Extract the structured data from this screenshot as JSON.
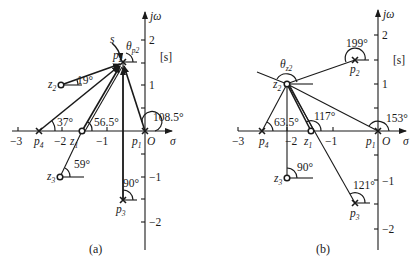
{
  "figure": {
    "panels": [
      {
        "id": "a",
        "caption": "(a)",
        "plane_label": "[s]",
        "axis": {
          "x_label": "σ",
          "y_label": "jω",
          "origin_label": "O",
          "x_ticks": [
            "−3",
            "−2",
            "−1"
          ],
          "y_ticks": [
            "2",
            "1",
            "−1",
            "−2"
          ]
        },
        "poles": [
          {
            "name": "p1",
            "label": "p",
            "sub": "1",
            "re": 0,
            "im": 0
          },
          {
            "name": "p2",
            "label": "p",
            "sub": "2",
            "re": -0.5,
            "im": 1.5
          },
          {
            "name": "p3",
            "label": "p",
            "sub": "3",
            "re": -0.5,
            "im": -1.5
          },
          {
            "name": "p4",
            "label": "p",
            "sub": "4",
            "re": -2.5,
            "im": 0
          }
        ],
        "zeros": [
          {
            "name": "z1",
            "label": "z",
            "sub": "1",
            "re": -1.5,
            "im": 0
          },
          {
            "name": "z2",
            "label": "z",
            "sub": "2",
            "re": -2,
            "im": 1
          },
          {
            "name": "z3",
            "label": "z",
            "sub": "3",
            "re": -2,
            "im": -1
          }
        ],
        "angles": [
          "19°",
          "37°",
          "56.5°",
          "108.5°",
          "59°",
          "90°"
        ],
        "departure_angle_label": "θ",
        "departure_angle_sub": "p2",
        "test_point_label": "s"
      },
      {
        "id": "b",
        "caption": "(b)",
        "plane_label": "[s]",
        "axis": {
          "x_label": "σ",
          "y_label": "jω",
          "origin_label": "O",
          "x_ticks": [
            "−3",
            "−2",
            "−1"
          ],
          "y_ticks": [
            "2",
            "1",
            "−1",
            "−2"
          ]
        },
        "poles": [
          {
            "name": "p1",
            "label": "p",
            "sub": "1",
            "re": 0,
            "im": 0
          },
          {
            "name": "p2",
            "label": "p",
            "sub": "2",
            "re": -0.5,
            "im": 1.5
          },
          {
            "name": "p3",
            "label": "p",
            "sub": "3",
            "re": -0.5,
            "im": -1.5
          },
          {
            "name": "p4",
            "label": "p",
            "sub": "4",
            "re": -2.5,
            "im": 0
          }
        ],
        "zeros": [
          {
            "name": "z1",
            "label": "z",
            "sub": "1",
            "re": -1.5,
            "im": 0
          },
          {
            "name": "z2",
            "label": "z",
            "sub": "2",
            "re": -2,
            "im": 1
          },
          {
            "name": "z3",
            "label": "z",
            "sub": "3",
            "re": -2,
            "im": -1
          }
        ],
        "angles": [
          "199°",
          "63.5°",
          "117°",
          "153°",
          "90°",
          "121°"
        ],
        "arrival_angle_label": "θ",
        "arrival_angle_sub": "z2"
      }
    ]
  }
}
